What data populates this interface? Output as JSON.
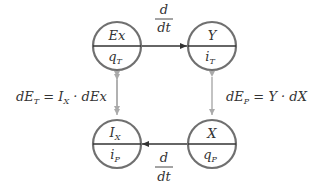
{
  "diagram": {
    "colors": {
      "circle_stroke": "#707070",
      "flow_arrow": "#333333",
      "link_arrow": "#aaaaaa",
      "text": "#333333",
      "background": "#ffffff"
    },
    "nodes": [
      {
        "id": "ex",
        "top": "Ex",
        "bottom_main": "q",
        "bottom_sub": "T"
      },
      {
        "id": "y",
        "top": "Y",
        "bottom_main": "i",
        "bottom_sub": "T"
      },
      {
        "id": "ix",
        "top_main": "I",
        "top_sub": "X",
        "bottom_main": "i",
        "bottom_sub": "P"
      },
      {
        "id": "x",
        "top": "X",
        "bottom_main": "q",
        "bottom_sub": "P"
      }
    ],
    "edges": {
      "top_derivative": {
        "num": "d",
        "den": "dt",
        "from": "ex",
        "to": "y"
      },
      "bottom_derivative": {
        "num": "d",
        "den": "dt",
        "from": "x",
        "to": "ix"
      },
      "left_link": {
        "from": "ex",
        "to": "ix",
        "bidirectional": true
      },
      "right_link": {
        "from": "y",
        "to": "x",
        "bidirectional": true
      }
    },
    "equations": {
      "left": {
        "lhs": "dE",
        "lhs_sub": "T",
        "eq": " = ",
        "rhs1": "I",
        "rhs1_sub": "X",
        "rest": " · dEx"
      },
      "right": {
        "lhs": "dE",
        "lhs_sub": "P",
        "eq": " = ",
        "rest": "Y · dX"
      }
    }
  }
}
